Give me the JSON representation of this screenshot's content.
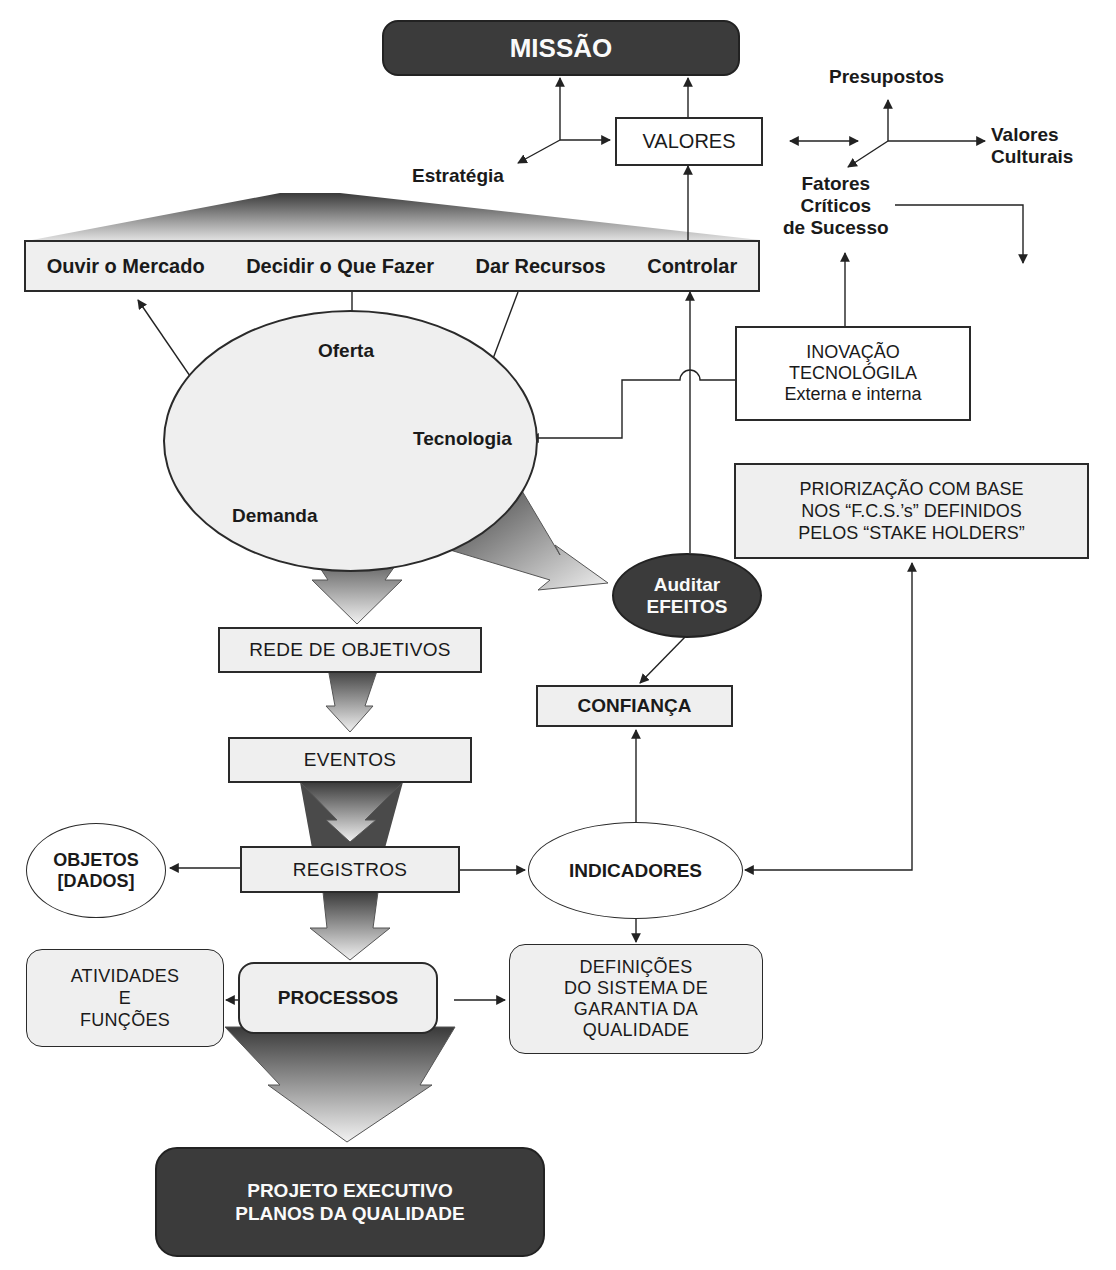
{
  "diagram": {
    "top": {
      "missao": "MISSÃO",
      "valores": "VALORES",
      "estrategia": "Estratégia",
      "presupostos": "Presupostos",
      "valores_culturais": "Valores\nCulturais",
      "fatores_criticos": "Fatores\nCríticos\nde Sucesso"
    },
    "management_bar": {
      "items": [
        {
          "label": "Ouvir o Mercado"
        },
        {
          "label": "Decidir o Que Fazer"
        },
        {
          "label": "Dar Recursos"
        },
        {
          "label": "Controlar"
        }
      ]
    },
    "market_ellipse": {
      "oferta": "Oferta",
      "tecnologia": "Tecnologia",
      "demanda": "Demanda"
    },
    "inovacao": {
      "line1": "INOVAÇÃO",
      "line2": "TECNOLÓGILA",
      "line3": "Externa e interna"
    },
    "priorizacao": "PRIORIZAÇÃO COM BASE\nNOS “F.C.S.’s” DEFINIDOS\nPELOS “STAKE HOLDERS”",
    "auditar": "Auditar\nEFEITOS",
    "confianca": "CONFIANÇA",
    "flow": {
      "rede_objetivos": "REDE DE OBJETIVOS",
      "eventos": "EVENTOS",
      "registros": "REGISTROS",
      "processos": "PROCESSOS"
    },
    "objetos": "OBJETOS\n[DADOS]",
    "indicadores": "INDICADORES",
    "atividades": "ATIVIDADES\nE\nFUNÇÕES",
    "definicoes": "DEFINIÇÕES\nDO SISTEMA DE\nGARANTIA DA\nQUALIDADE",
    "projeto": "PROJETO EXECUTIVO\nPLANOS DA QUALIDADE"
  },
  "colors": {
    "dark_fill": "#3b3b3b",
    "light_fill": "#efefef",
    "stroke": "#2a2a2a"
  }
}
